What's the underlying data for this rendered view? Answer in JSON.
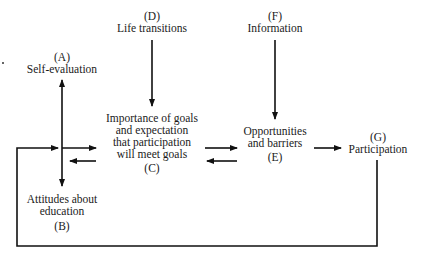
{
  "diagram": {
    "type": "flow",
    "nodes": {
      "A": {
        "letter": "(A)",
        "lines": [
          "Self-evaluation"
        ]
      },
      "B": {
        "letter": "(B)",
        "lines": [
          "Attitudes about",
          "education"
        ]
      },
      "C": {
        "letter": "(C)",
        "lines": [
          "Importance of goals",
          "and expectation",
          "that participation",
          "will meet goals"
        ]
      },
      "D": {
        "letter": "(D)",
        "lines": [
          "Life transitions"
        ]
      },
      "E": {
        "letter": "(E)",
        "lines": [
          "Opportunities",
          "and barriers"
        ]
      },
      "F": {
        "letter": "(F)",
        "lines": [
          "Information"
        ]
      },
      "G": {
        "letter": "(G)",
        "lines": [
          "Participation"
        ]
      }
    },
    "edges": [
      {
        "from": "A",
        "to": "B",
        "bidirectional": true
      },
      {
        "from": "AB",
        "to": "C"
      },
      {
        "from": "C",
        "to": "AB"
      },
      {
        "from": "D",
        "to": "C"
      },
      {
        "from": "F",
        "to": "E"
      },
      {
        "from": "C",
        "to": "E"
      },
      {
        "from": "E",
        "to": "C"
      },
      {
        "from": "E",
        "to": "G"
      },
      {
        "from": "G",
        "to": "AB",
        "type": "feedback-loop"
      }
    ],
    "line_color": "#111111"
  }
}
